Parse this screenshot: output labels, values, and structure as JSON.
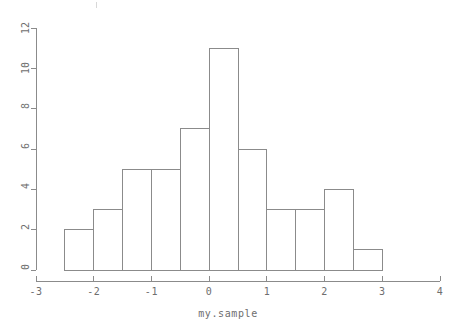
{
  "chart_data": {
    "type": "bar",
    "title": "",
    "subtitle": "",
    "xlabel": "my.sample",
    "ylabel": "",
    "xlim": [
      -3,
      4
    ],
    "ylim": [
      0,
      12
    ],
    "grid": false,
    "legend": false,
    "bin_width": 0.5,
    "bin_edges": [
      -2.5,
      -2.0,
      -1.5,
      -1.0,
      -0.5,
      0.0,
      0.5,
      1.0,
      1.5,
      2.0,
      2.5,
      3.0
    ],
    "categories": [
      "[-2.5,-2.0)",
      "[-2.0,-1.5)",
      "[-1.5,-1.0)",
      "[-1.0,-0.5)",
      "[-0.5,0.0)",
      "[0.0,0.5)",
      "[0.5,1.0)",
      "[1.0,1.5)",
      "[1.5,2.0)",
      "[2.0,2.5)",
      "[2.5,3.0)"
    ],
    "values": [
      2,
      3,
      5,
      5,
      7,
      11,
      6,
      3,
      3,
      4,
      1
    ],
    "x_ticks": [
      -3,
      -2,
      -1,
      0,
      1,
      2,
      3,
      4
    ],
    "x_tick_labels": [
      "-3",
      "-2",
      "-1",
      "0",
      "1",
      "2",
      "3",
      "4"
    ],
    "y_ticks": [
      0,
      2,
      4,
      6,
      8,
      10,
      12
    ],
    "y_tick_labels": [
      "0",
      "2",
      "4",
      "6",
      "8",
      "10",
      "12"
    ],
    "colors": {
      "bar_stroke": "#8b8b8b",
      "bar_fill": "#ffffff",
      "axis": "#8b8b8b",
      "text": "#6e6e6e",
      "background": "#ffffff"
    }
  },
  "axis_label": {
    "x": "my.sample"
  },
  "x_labels": {
    "t0": "-3",
    "t1": "-2",
    "t2": "-1",
    "t3": "0",
    "t4": "1",
    "t5": "2",
    "t6": "3",
    "t7": "4"
  },
  "y_labels": {
    "t0": "0",
    "t1": "2",
    "t2": "4",
    "t3": "6",
    "t4": "8",
    "t5": "10",
    "t6": "12"
  }
}
